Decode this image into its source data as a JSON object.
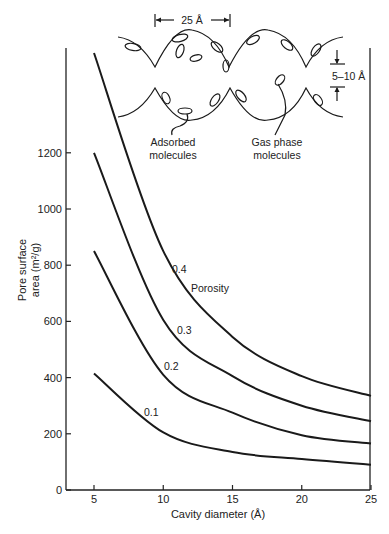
{
  "chart_data": {
    "type": "line",
    "title": "",
    "xlabel": "Cavity diameter (Å)",
    "ylabel": "Pore surface area (m²/g)",
    "ylabel_lines": [
      "Pore surface",
      "area (m²/g)"
    ],
    "xlim": [
      5,
      25
    ],
    "ylim": [
      0,
      1600
    ],
    "x_ticks": [
      5,
      10,
      15,
      20,
      25
    ],
    "y_ticks": [
      0,
      200,
      400,
      600,
      800,
      1000,
      1200
    ],
    "grid": false,
    "legend": "inline curve labels",
    "legend_title": "Porosity",
    "x": [
      5,
      10,
      15,
      20,
      25
    ],
    "series": [
      {
        "name": "0.4",
        "values": [
          1555,
          850,
          545,
          405,
          335
        ]
      },
      {
        "name": "0.3",
        "values": [
          1200,
          605,
          405,
          300,
          245
        ]
      },
      {
        "name": "0.2",
        "values": [
          850,
          410,
          275,
          195,
          165
        ]
      },
      {
        "name": "0.1",
        "values": [
          415,
          205,
          135,
          110,
          90
        ]
      }
    ]
  },
  "inset_diagram": {
    "width_label": "25 Å",
    "window_label": "5–10 Å",
    "adsorbed_label_lines": [
      "Adsorbed",
      "molecules"
    ],
    "gas_label_lines": [
      "Gas phase",
      "molecules"
    ]
  },
  "curve_labels": {
    "porosity": "Porosity",
    "s04": "0.4",
    "s03": "0.3",
    "s02": "0.2",
    "s01": "0.1"
  }
}
